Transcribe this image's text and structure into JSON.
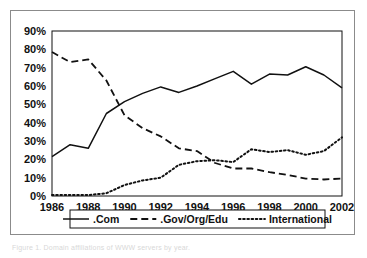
{
  "figure": {
    "caption_text": "Figure 1.  Domain affiliations of WWW servers by year.",
    "background_color": "#ffffff",
    "frame_color": "#8b8b8b",
    "axis_color": "#111111",
    "line_color": "#111111"
  },
  "chart_data": {
    "type": "line",
    "title": "",
    "subtitle": "",
    "xlabel": "",
    "ylabel": "",
    "x": [
      1986,
      1987,
      1988,
      1989,
      1990,
      1991,
      1992,
      1993,
      1994,
      1995,
      1996,
      1997,
      1998,
      1999,
      2000,
      2001,
      2002
    ],
    "xlim": [
      1986,
      2002
    ],
    "ylim": [
      0,
      90
    ],
    "ytick_values": [
      0,
      10,
      20,
      30,
      40,
      50,
      60,
      70,
      80,
      90
    ],
    "ytick_labels": [
      "0%",
      "10%",
      "20%",
      "30%",
      "40%",
      "50%",
      "60%",
      "70%",
      "80%",
      "90%"
    ],
    "xtick_values": [
      1986,
      1988,
      1990,
      1992,
      1994,
      1996,
      1998,
      2000,
      2002
    ],
    "xtick_labels": [
      "1986",
      "1988",
      "1990",
      "1992",
      "1994",
      "1996",
      "1998",
      "2000",
      "2002"
    ],
    "grid": false,
    "legend_position": "bottom",
    "series": [
      {
        "name": ".Com",
        "style": "solid",
        "color": "#111111",
        "values": [
          21.5,
          28.0,
          26.0,
          45.0,
          51.5,
          56.0,
          59.5,
          56.5,
          60.0,
          64.0,
          68.0,
          61.0,
          66.5,
          66.0,
          70.5,
          66.0,
          59.0
        ]
      },
      {
        "name": ".Gov/Org/Edu",
        "style": "dashed",
        "color": "#111111",
        "values": [
          78.5,
          73.0,
          74.5,
          63.0,
          44.0,
          37.0,
          32.5,
          26.0,
          24.5,
          18.0,
          15.0,
          15.0,
          13.0,
          11.5,
          9.5,
          9.0,
          9.5
        ]
      },
      {
        "name": "International",
        "style": "dotted",
        "color": "#111111",
        "values": [
          0.5,
          0.5,
          0.5,
          1.5,
          6.0,
          8.5,
          10.0,
          17.0,
          19.0,
          19.5,
          18.5,
          25.5,
          24.0,
          25.0,
          22.5,
          24.5,
          32.0
        ]
      }
    ]
  },
  "legend": {
    "items": [
      {
        "label": ".Com",
        "style": "solid"
      },
      {
        "label": ".Gov/Org/Edu",
        "style": "dashed"
      },
      {
        "label": "International",
        "style": "dotted"
      }
    ]
  }
}
